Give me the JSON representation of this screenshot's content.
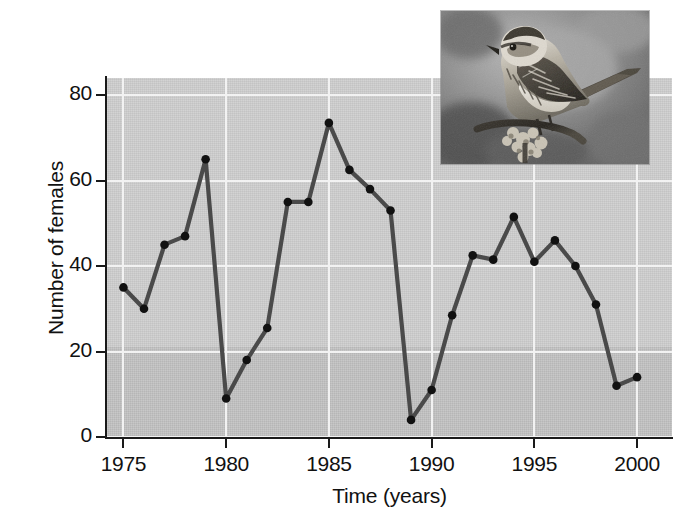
{
  "figure": {
    "background_color": "#ffffff",
    "plot_background_color": "#c9c9c9",
    "gridline_color": "#f2f2f2",
    "series_color": "#4a4a4a",
    "marker_color": "#111111",
    "axis_color": "#1a1a1a"
  },
  "chart_data": {
    "type": "line",
    "title": "",
    "subtitle": "",
    "xlabel": "Time (years)",
    "ylabel": "Number of females",
    "xlim": [
      1974.2,
      2001.7
    ],
    "ylim": [
      0,
      84
    ],
    "xticks": [
      1975,
      1980,
      1985,
      1990,
      1995,
      2000
    ],
    "xtick_labels": [
      "1975",
      "1980",
      "1985",
      "1990",
      "1995",
      "2000"
    ],
    "yticks": [
      0,
      20,
      40,
      60,
      80
    ],
    "ytick_labels": [
      "0",
      "20",
      "40",
      "60",
      "80"
    ],
    "grid": true,
    "grid_axis": "both",
    "legend": false,
    "legend_position": "none",
    "markers": "filled-circle",
    "x": [
      1975,
      1976,
      1977,
      1978,
      1979,
      1980,
      1981,
      1982,
      1983,
      1984,
      1985,
      1986,
      1987,
      1988,
      1989,
      1990,
      1991,
      1992,
      1993,
      1994,
      1995,
      1996,
      1997,
      1998,
      1999,
      2000
    ],
    "values": [
      35,
      30,
      45,
      47,
      65,
      9,
      18,
      25.5,
      55,
      55,
      73.5,
      62.5,
      58,
      53,
      4,
      11,
      28.5,
      42.5,
      41.5,
      51.5,
      41,
      46,
      40,
      31,
      12,
      14
    ],
    "series": [
      {
        "name": "Number of females",
        "values": [
          35,
          30,
          45,
          47,
          65,
          9,
          18,
          25.5,
          55,
          55,
          73.5,
          62.5,
          58,
          53,
          4,
          11,
          28.5,
          42.5,
          41.5,
          51.5,
          41,
          46,
          40,
          31,
          12,
          14
        ]
      }
    ]
  },
  "inset": {
    "caption": "",
    "description": "song-sparrow-photo",
    "alt": "Grayscale photograph of a song sparrow perched on a twig"
  }
}
